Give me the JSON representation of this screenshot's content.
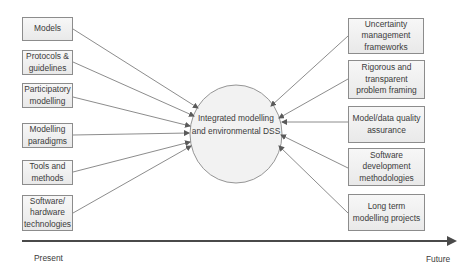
{
  "diagram": {
    "center": {
      "label": "Integrated modelling and environmental DSS"
    },
    "left_inputs": [
      {
        "label": "Models"
      },
      {
        "label": "Protocols & guidelines"
      },
      {
        "label": "Participatory modelling"
      },
      {
        "label": "Modelling paradigms"
      },
      {
        "label": "Tools and methods"
      },
      {
        "label": "Software/ hardware technologies"
      }
    ],
    "right_inputs": [
      {
        "label": "Uncertainty management frameworks"
      },
      {
        "label": "Rigorous and transparent problem framing"
      },
      {
        "label": "Model/data quality assurance"
      },
      {
        "label": "Software development methodologies"
      },
      {
        "label": "Long term modelling projects"
      }
    ],
    "timeline": {
      "start_label": "Present",
      "end_label": "Future"
    },
    "colors": {
      "line": "#6e6e6e",
      "box_border": "#8c8c8c",
      "box_fill": "#eeeeee",
      "timeline": "#4a4a4a"
    }
  }
}
